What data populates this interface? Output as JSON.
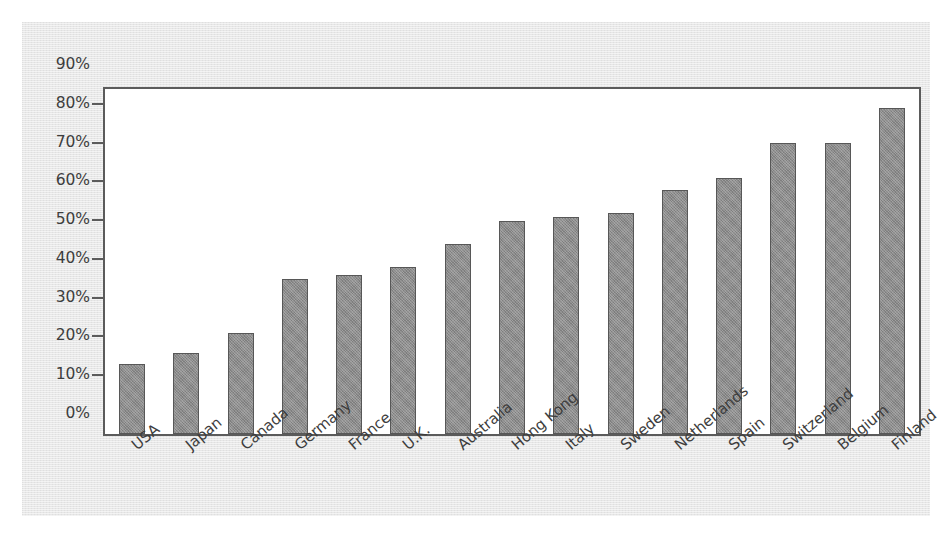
{
  "chart_data": {
    "type": "bar",
    "title": "",
    "subtitle": "",
    "xlabel": "",
    "ylabel": "",
    "ylim": [
      0,
      90
    ],
    "ytick_values": [
      0,
      10,
      20,
      30,
      40,
      50,
      60,
      70,
      80,
      90
    ],
    "ytick_labels": [
      "0%",
      "10%",
      "20%",
      "30%",
      "40%",
      "50%",
      "60%",
      "70%",
      "80%",
      "90%"
    ],
    "grid": false,
    "legend": null,
    "legend_position": "none",
    "annotations": [],
    "categories": [
      "USA",
      "Japan",
      "Canada",
      "Germany",
      "France",
      "U.K.",
      "Australia",
      "Hong Kong",
      "Italy",
      "Sweden",
      "Netherlands",
      "Spain",
      "Switzerland",
      "Belgium",
      "Finland"
    ],
    "values": [
      18,
      21,
      26,
      40,
      41,
      43,
      49,
      55,
      56,
      57,
      63,
      66,
      75,
      75,
      84
    ],
    "value_labels": [
      "18%",
      "21%",
      "26%",
      "40%",
      "41%",
      "43%",
      "49%",
      "55%",
      "56%",
      "57%",
      "63%",
      "66%",
      "75%",
      "75%",
      "84%"
    ],
    "series": [
      {
        "name": "",
        "values": [
          18,
          21,
          26,
          40,
          41,
          43,
          49,
          55,
          56,
          57,
          63,
          66,
          75,
          75,
          84
        ]
      }
    ]
  },
  "style": {
    "bar_fill": "#8c8c8c",
    "bar_border": "#575757",
    "axis_color": "#5b5b5b",
    "plot_background": "#ffffff",
    "panel_background": "#e7e7e7",
    "page_background": "#ffffff",
    "text_color": "#3d3d3d"
  }
}
